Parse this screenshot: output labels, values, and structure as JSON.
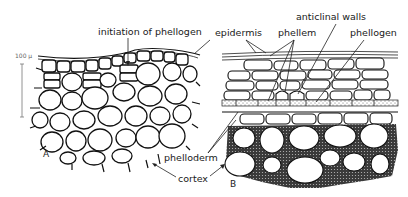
{
  "figure": {
    "scale_bar": {
      "label": "100 μ"
    },
    "panels": [
      {
        "id": "A",
        "label": "A"
      },
      {
        "id": "B",
        "label": "B"
      }
    ],
    "labels": {
      "initiation_of_phellogen": "initiation of phellogen",
      "epidermis": "epidermis",
      "phellem": "phellem",
      "anticlinal_walls": "anticlinal walls",
      "phellogen": "phellogen",
      "phelloderm": "phelloderm",
      "cortex": "cortex"
    },
    "colors": {
      "ink": "#111111",
      "background": "#ffffff",
      "stipple": "#555555"
    }
  }
}
